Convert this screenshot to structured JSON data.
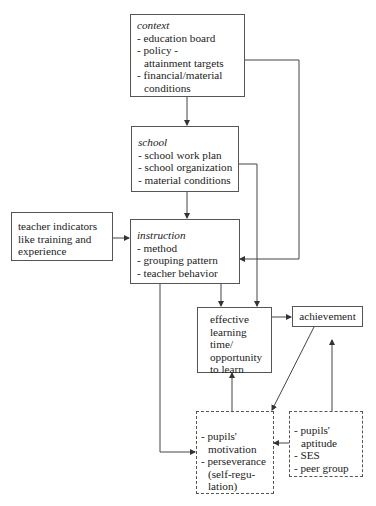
{
  "diagram": {
    "nodes": {
      "context": {
        "title": "context",
        "lines": [
          "- education board",
          "- policy -",
          "attainment targets",
          "- financial/material",
          "conditions"
        ]
      },
      "school": {
        "title": "school",
        "lines": [
          "- school work plan",
          "- school organization",
          "- material conditions"
        ]
      },
      "teacher": {
        "lines": [
          "teacher indicators",
          "like training and",
          "experience"
        ]
      },
      "instruction": {
        "title": "instruction",
        "lines": [
          "- method",
          "- grouping pattern",
          "- teacher behavior"
        ]
      },
      "effective": {
        "lines": [
          "effective",
          "learning",
          "time/",
          "opportunity",
          "to learn"
        ]
      },
      "achievement": {
        "label": "achievement"
      },
      "motivation": {
        "lines": [
          "- pupils'",
          "motivation",
          "- perseverance",
          "(self-regu-",
          "lation)"
        ]
      },
      "aptitude": {
        "lines": [
          "- pupils'",
          "aptitude",
          "- SES",
          "- peer group"
        ]
      }
    },
    "edges": [
      {
        "from": "context",
        "to": "school"
      },
      {
        "from": "context",
        "to": "instruction"
      },
      {
        "from": "school",
        "to": "instruction"
      },
      {
        "from": "school",
        "to": "effective"
      },
      {
        "from": "teacher",
        "to": "instruction"
      },
      {
        "from": "instruction",
        "to": "effective"
      },
      {
        "from": "instruction",
        "to": "motivation"
      },
      {
        "from": "effective",
        "to": "achievement"
      },
      {
        "from": "achievement",
        "to": "motivation"
      },
      {
        "from": "motivation",
        "to": "effective"
      },
      {
        "from": "aptitude",
        "to": "motivation"
      },
      {
        "from": "aptitude",
        "to": "achievement"
      }
    ],
    "colors": {
      "line": "#444444",
      "border": "#555555",
      "text": "#222222"
    }
  }
}
